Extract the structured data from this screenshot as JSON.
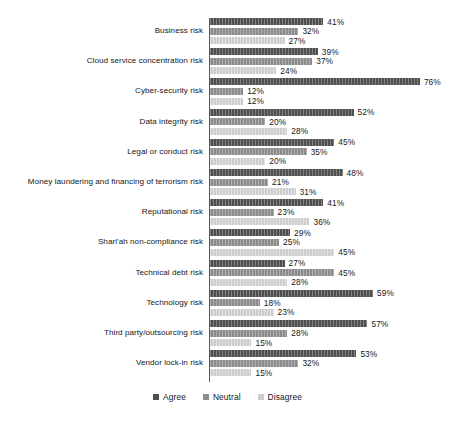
{
  "chart_data": {
    "type": "bar",
    "orientation": "horizontal",
    "title": "",
    "subtitle": "",
    "xlabel": "",
    "ylabel": "",
    "xlim": [
      0,
      80
    ],
    "grid": false,
    "legend_position": "bottom-center",
    "value_label_suffix": "%",
    "categories": [
      "Business risk",
      "Cloud service concentration risk",
      "Cyber-security risk",
      "Data integrity risk",
      "Legal or conduct risk",
      "Money laundering and financing of terrorism risk",
      "Reputational risk",
      "Shari'ah non-compliance risk",
      "Technical debt risk",
      "Technology risk",
      "Third party/outsourcing risk",
      "Vendor lock-in risk"
    ],
    "series": [
      {
        "name": "Agree",
        "color": "#4f4f4f",
        "values": [
          41,
          39,
          76,
          52,
          45,
          48,
          41,
          29,
          27,
          59,
          57,
          53
        ],
        "labels": [
          "41%",
          "39%",
          "76%",
          "52%",
          "45%",
          "48%",
          "41%",
          "29%",
          "27%",
          "59%",
          "57%",
          "53%"
        ]
      },
      {
        "name": "Neutral",
        "color": "#8c8c8c",
        "values": [
          32,
          37,
          12,
          20,
          35,
          21,
          23,
          25,
          45,
          18,
          28,
          32
        ],
        "labels": [
          "32%",
          "37%",
          "12%",
          "20%",
          "35%",
          "21%",
          "23%",
          "25%",
          "45%",
          "18%",
          "28%",
          "32%"
        ]
      },
      {
        "name": "Disagree",
        "color": "#cdcdcd",
        "values": [
          27,
          24,
          12,
          28,
          20,
          31,
          36,
          45,
          28,
          23,
          15,
          15
        ],
        "labels": [
          "27%",
          "24%",
          "12%",
          "28%",
          "20%",
          "31%",
          "36%",
          "45%",
          "28%",
          "23%",
          "15%",
          "15%"
        ]
      }
    ]
  },
  "legend": {
    "items": [
      {
        "label": "Agree",
        "color": "#4f4f4f"
      },
      {
        "label": "Neutral",
        "color": "#8c8c8c"
      },
      {
        "label": "Disagree",
        "color": "#cdcdcd"
      }
    ]
  }
}
